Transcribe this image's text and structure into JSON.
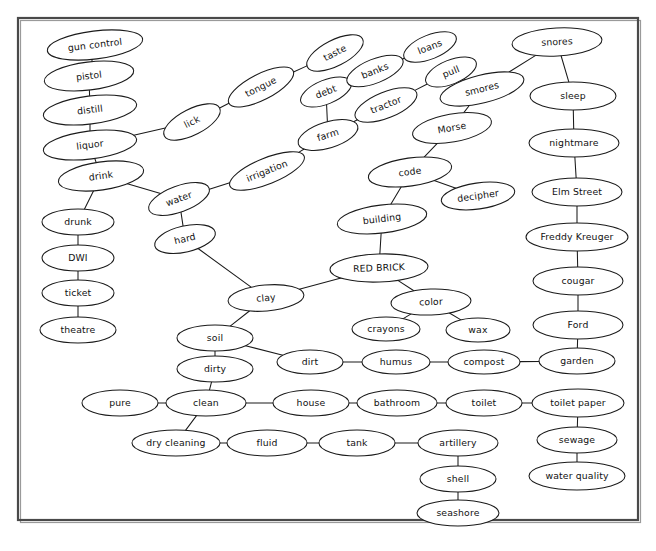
{
  "document": {
    "type": "concept-map",
    "title": "RED BRICK semantic network",
    "root_node": "RED BRICK",
    "background_color": "#ffffff",
    "border_color": "#4a4a4a",
    "node_fill": "#ffffff",
    "node_stroke": "#1a1a1a",
    "edge_color": "#1a1a1a"
  },
  "frame": {
    "x": 18,
    "y": 18,
    "width": 620,
    "height": 502
  },
  "nodes": [
    {
      "id": "gun_control",
      "label": "gun control",
      "cx": 95,
      "cy": 45,
      "rx": 48,
      "ry": 14,
      "rot": -7
    },
    {
      "id": "pistol",
      "label": "pistol",
      "cx": 89,
      "cy": 76,
      "rx": 45,
      "ry": 14,
      "rot": -7
    },
    {
      "id": "distill",
      "label": "distill",
      "cx": 90,
      "cy": 110,
      "rx": 47,
      "ry": 14,
      "rot": -7
    },
    {
      "id": "liquor",
      "label": "liquor",
      "cx": 90,
      "cy": 145,
      "rx": 47,
      "ry": 14,
      "rot": -7
    },
    {
      "id": "drink",
      "label": "drink",
      "cx": 101,
      "cy": 176,
      "rx": 43,
      "ry": 14,
      "rot": -8
    },
    {
      "id": "drunk",
      "label": "drunk",
      "cx": 78,
      "cy": 222,
      "rx": 36,
      "ry": 13,
      "rot": 0
    },
    {
      "id": "dwi",
      "label": "DWI",
      "cx": 78,
      "cy": 258,
      "rx": 36,
      "ry": 13,
      "rot": 0
    },
    {
      "id": "ticket",
      "label": "ticket",
      "cx": 78,
      "cy": 293,
      "rx": 36,
      "ry": 13,
      "rot": 0
    },
    {
      "id": "theatre",
      "label": "theatre",
      "cx": 78,
      "cy": 330,
      "rx": 38,
      "ry": 13,
      "rot": 0
    },
    {
      "id": "lick",
      "label": "lick",
      "cx": 192,
      "cy": 122,
      "rx": 31,
      "ry": 13,
      "rot": -27
    },
    {
      "id": "tongue",
      "label": "tongue",
      "cx": 261,
      "cy": 87,
      "rx": 36,
      "ry": 13,
      "rot": -27
    },
    {
      "id": "taste",
      "label": "taste",
      "cx": 335,
      "cy": 53,
      "rx": 31,
      "ry": 13,
      "rot": -27
    },
    {
      "id": "water",
      "label": "water",
      "cx": 179,
      "cy": 199,
      "rx": 32,
      "ry": 13,
      "rot": -20
    },
    {
      "id": "hard",
      "label": "hard",
      "cx": 185,
      "cy": 239,
      "rx": 31,
      "ry": 13,
      "rot": -13
    },
    {
      "id": "irrigation",
      "label": "irrigation",
      "cx": 267,
      "cy": 171,
      "rx": 40,
      "ry": 13,
      "rot": -22
    },
    {
      "id": "farm",
      "label": "farm",
      "cx": 328,
      "cy": 135,
      "rx": 31,
      "ry": 13,
      "rot": -17
    },
    {
      "id": "debt",
      "label": "debt",
      "cx": 326,
      "cy": 92,
      "rx": 27,
      "ry": 12,
      "rot": -22
    },
    {
      "id": "banks",
      "label": "banks",
      "cx": 375,
      "cy": 71,
      "rx": 30,
      "ry": 12,
      "rot": -22
    },
    {
      "id": "loans",
      "label": "loans",
      "cx": 430,
      "cy": 47,
      "rx": 28,
      "ry": 12,
      "rot": -22
    },
    {
      "id": "tractor",
      "label": "tractor",
      "cx": 386,
      "cy": 105,
      "rx": 33,
      "ry": 13,
      "rot": -22
    },
    {
      "id": "pull",
      "label": "pull",
      "cx": 451,
      "cy": 72,
      "rx": 27,
      "ry": 12,
      "rot": -22
    },
    {
      "id": "smores",
      "label": "smores",
      "cx": 482,
      "cy": 89,
      "rx": 43,
      "ry": 14,
      "rot": -14
    },
    {
      "id": "snores",
      "label": "snores",
      "cx": 557,
      "cy": 42,
      "rx": 45,
      "ry": 14,
      "rot": -3
    },
    {
      "id": "sleep",
      "label": "sleep",
      "cx": 573,
      "cy": 96,
      "rx": 43,
      "ry": 14,
      "rot": 0
    },
    {
      "id": "nightmare",
      "label": "nightmare",
      "cx": 574,
      "cy": 143,
      "rx": 45,
      "ry": 14,
      "rot": 0
    },
    {
      "id": "elm_street",
      "label": "Elm Street",
      "cx": 577,
      "cy": 192,
      "rx": 45,
      "ry": 14,
      "rot": 0
    },
    {
      "id": "freddy",
      "label": "Freddy Kreuger",
      "cx": 577,
      "cy": 237,
      "rx": 51,
      "ry": 14,
      "rot": 0
    },
    {
      "id": "cougar",
      "label": "cougar",
      "cx": 578,
      "cy": 281,
      "rx": 45,
      "ry": 14,
      "rot": 0
    },
    {
      "id": "ford",
      "label": "Ford",
      "cx": 578,
      "cy": 325,
      "rx": 45,
      "ry": 14,
      "rot": 0
    },
    {
      "id": "garden",
      "label": "garden",
      "cx": 577,
      "cy": 361,
      "rx": 38,
      "ry": 13,
      "rot": 0
    },
    {
      "id": "toilet_paper",
      "label": "toilet paper",
      "cx": 578,
      "cy": 403,
      "rx": 46,
      "ry": 14,
      "rot": 0
    },
    {
      "id": "sewage",
      "label": "sewage",
      "cx": 577,
      "cy": 440,
      "rx": 40,
      "ry": 13,
      "rot": 0
    },
    {
      "id": "water_quality",
      "label": "water quality",
      "cx": 577,
      "cy": 476,
      "rx": 48,
      "ry": 14,
      "rot": 0
    },
    {
      "id": "morse",
      "label": "Morse",
      "cx": 452,
      "cy": 128,
      "rx": 40,
      "ry": 14,
      "rot": -10
    },
    {
      "id": "code",
      "label": "code",
      "cx": 410,
      "cy": 172,
      "rx": 42,
      "ry": 14,
      "rot": -8
    },
    {
      "id": "decipher",
      "label": "decipher",
      "cx": 478,
      "cy": 196,
      "rx": 37,
      "ry": 13,
      "rot": -8
    },
    {
      "id": "building",
      "label": "building",
      "cx": 382,
      "cy": 219,
      "rx": 45,
      "ry": 14,
      "rot": -7
    },
    {
      "id": "red_brick",
      "label": "RED BRICK",
      "cx": 379,
      "cy": 268,
      "rx": 49,
      "ry": 14,
      "rot": -2
    },
    {
      "id": "clay",
      "label": "clay",
      "cx": 266,
      "cy": 298,
      "rx": 38,
      "ry": 13,
      "rot": -5
    },
    {
      "id": "color",
      "label": "color",
      "cx": 431,
      "cy": 302,
      "rx": 40,
      "ry": 13,
      "rot": -2
    },
    {
      "id": "crayons",
      "label": "crayons",
      "cx": 386,
      "cy": 329,
      "rx": 34,
      "ry": 12,
      "rot": 0
    },
    {
      "id": "wax",
      "label": "wax",
      "cx": 478,
      "cy": 330,
      "rx": 32,
      "ry": 12,
      "rot": 0
    },
    {
      "id": "soil",
      "label": "soil",
      "cx": 215,
      "cy": 338,
      "rx": 38,
      "ry": 13,
      "rot": 0
    },
    {
      "id": "dirty",
      "label": "dirty",
      "cx": 215,
      "cy": 369,
      "rx": 38,
      "ry": 13,
      "rot": 0
    },
    {
      "id": "dirt",
      "label": "dirt",
      "cx": 310,
      "cy": 362,
      "rx": 33,
      "ry": 12,
      "rot": 0
    },
    {
      "id": "humus",
      "label": "humus",
      "cx": 396,
      "cy": 362,
      "rx": 34,
      "ry": 12,
      "rot": 0
    },
    {
      "id": "compost",
      "label": "compost",
      "cx": 484,
      "cy": 362,
      "rx": 36,
      "ry": 12,
      "rot": 0
    },
    {
      "id": "pure",
      "label": "pure",
      "cx": 120,
      "cy": 403,
      "rx": 38,
      "ry": 13,
      "rot": 0
    },
    {
      "id": "clean",
      "label": "clean",
      "cx": 206,
      "cy": 403,
      "rx": 40,
      "ry": 13,
      "rot": 0
    },
    {
      "id": "house",
      "label": "house",
      "cx": 311,
      "cy": 403,
      "rx": 38,
      "ry": 13,
      "rot": 0
    },
    {
      "id": "bathroom",
      "label": "bathroom",
      "cx": 397,
      "cy": 403,
      "rx": 40,
      "ry": 13,
      "rot": 0
    },
    {
      "id": "toilet",
      "label": "toilet",
      "cx": 484,
      "cy": 403,
      "rx": 38,
      "ry": 13,
      "rot": 0
    },
    {
      "id": "dry_cleaning",
      "label": "dry cleaning",
      "cx": 176,
      "cy": 443,
      "rx": 44,
      "ry": 13,
      "rot": 0
    },
    {
      "id": "fluid",
      "label": "fluid",
      "cx": 267,
      "cy": 443,
      "rx": 40,
      "ry": 13,
      "rot": 0
    },
    {
      "id": "tank",
      "label": "tank",
      "cx": 357,
      "cy": 443,
      "rx": 38,
      "ry": 13,
      "rot": 0
    },
    {
      "id": "artillery",
      "label": "artillery",
      "cx": 458,
      "cy": 443,
      "rx": 40,
      "ry": 13,
      "rot": 0
    },
    {
      "id": "shell",
      "label": "shell",
      "cx": 458,
      "cy": 479,
      "rx": 38,
      "ry": 13,
      "rot": 0
    },
    {
      "id": "seashore",
      "label": "seashore",
      "cx": 458,
      "cy": 513,
      "rx": 41,
      "ry": 13,
      "rot": 0
    }
  ],
  "edges": [
    [
      "gun_control",
      "pistol"
    ],
    [
      "pistol",
      "distill"
    ],
    [
      "distill",
      "liquor"
    ],
    [
      "liquor",
      "drink"
    ],
    [
      "liquor",
      "lick"
    ],
    [
      "drink",
      "drunk"
    ],
    [
      "drink",
      "water"
    ],
    [
      "drunk",
      "dwi"
    ],
    [
      "dwi",
      "ticket"
    ],
    [
      "ticket",
      "theatre"
    ],
    [
      "lick",
      "tongue"
    ],
    [
      "tongue",
      "taste"
    ],
    [
      "water",
      "hard"
    ],
    [
      "water",
      "irrigation"
    ],
    [
      "irrigation",
      "farm"
    ],
    [
      "farm",
      "debt"
    ],
    [
      "farm",
      "tractor"
    ],
    [
      "debt",
      "banks"
    ],
    [
      "banks",
      "loans"
    ],
    [
      "tractor",
      "pull"
    ],
    [
      "pull",
      "smores"
    ],
    [
      "smores",
      "snores"
    ],
    [
      "smores",
      "morse"
    ],
    [
      "snores",
      "sleep"
    ],
    [
      "sleep",
      "nightmare"
    ],
    [
      "nightmare",
      "elm_street"
    ],
    [
      "elm_street",
      "freddy"
    ],
    [
      "freddy",
      "cougar"
    ],
    [
      "cougar",
      "ford"
    ],
    [
      "ford",
      "garden"
    ],
    [
      "garden",
      "compost"
    ],
    [
      "toilet_paper",
      "toilet"
    ],
    [
      "toilet_paper",
      "sewage"
    ],
    [
      "sewage",
      "water_quality"
    ],
    [
      "morse",
      "code"
    ],
    [
      "code",
      "decipher"
    ],
    [
      "code",
      "building"
    ],
    [
      "building",
      "red_brick"
    ],
    [
      "red_brick",
      "clay"
    ],
    [
      "red_brick",
      "color"
    ],
    [
      "color",
      "crayons"
    ],
    [
      "color",
      "wax"
    ],
    [
      "hard",
      "clay"
    ],
    [
      "clay",
      "soil"
    ],
    [
      "soil",
      "dirty"
    ],
    [
      "soil",
      "dirt"
    ],
    [
      "dirt",
      "humus"
    ],
    [
      "humus",
      "compost"
    ],
    [
      "dirty",
      "clean"
    ],
    [
      "pure",
      "clean"
    ],
    [
      "clean",
      "house"
    ],
    [
      "clean",
      "dry_cleaning"
    ],
    [
      "house",
      "bathroom"
    ],
    [
      "bathroom",
      "toilet"
    ],
    [
      "dry_cleaning",
      "fluid"
    ],
    [
      "fluid",
      "tank"
    ],
    [
      "tank",
      "artillery"
    ],
    [
      "artillery",
      "shell"
    ],
    [
      "shell",
      "seashore"
    ]
  ]
}
